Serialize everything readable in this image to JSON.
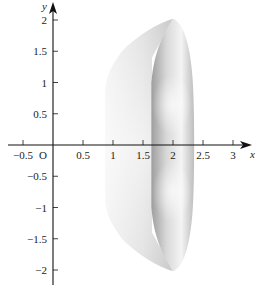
{
  "chart_data": {
    "type": "area",
    "title": "",
    "xlabel": "x",
    "ylabel": "y",
    "origin_label": "O",
    "xlim": [
      -0.6,
      3.2
    ],
    "ylim": [
      -2.2,
      2.2
    ],
    "grid": false,
    "x_ticks": [
      -0.5,
      0.5,
      1,
      1.5,
      2,
      2.5,
      3
    ],
    "x_tick_labels": [
      "-0.5",
      "0.5",
      "1",
      "1.5",
      "2",
      "2.5",
      "3"
    ],
    "y_ticks": [
      2,
      1.5,
      1,
      0.5,
      -0.5,
      -1,
      -1.5,
      -2
    ],
    "y_tick_labels": [
      "2",
      "1.5",
      "1",
      "0.5",
      "-0.5",
      "-1",
      "-1.5",
      "-2"
    ],
    "shape": {
      "left_face_outline": [
        [
          0.85,
          1.0
        ],
        [
          0.9,
          1.2
        ],
        [
          1.2,
          1.55
        ],
        [
          1.6,
          1.8
        ],
        [
          2.0,
          2.0
        ],
        [
          0.85,
          0.0
        ],
        [
          0.85,
          -1.0
        ],
        [
          0.9,
          -1.2
        ],
        [
          1.2,
          -1.55
        ],
        [
          1.6,
          -1.8
        ],
        [
          2.0,
          -2.0
        ]
      ],
      "right_band_outline": [
        [
          2.0,
          2.0
        ],
        [
          2.2,
          1.7
        ],
        [
          2.33,
          1.0
        ],
        [
          2.35,
          0.0
        ],
        [
          2.33,
          -1.0
        ],
        [
          2.2,
          -1.7
        ],
        [
          2.0,
          -2.0
        ],
        [
          1.65,
          -1.2
        ],
        [
          1.65,
          0.0
        ],
        [
          1.65,
          1.2
        ]
      ],
      "top_point": [
        2.0,
        2.0
      ],
      "bottom_point": [
        2.0,
        -2.0
      ],
      "x_extent": [
        0.85,
        2.35
      ],
      "y_extent": [
        -2.0,
        2.0
      ]
    },
    "colors": {
      "axis": "#111111",
      "left_face_light": "#f4f4f4",
      "left_face_dark": "#c8c8c8",
      "right_band_dark": "#9a9a9a",
      "right_band_light": "#f6f6f6"
    }
  }
}
